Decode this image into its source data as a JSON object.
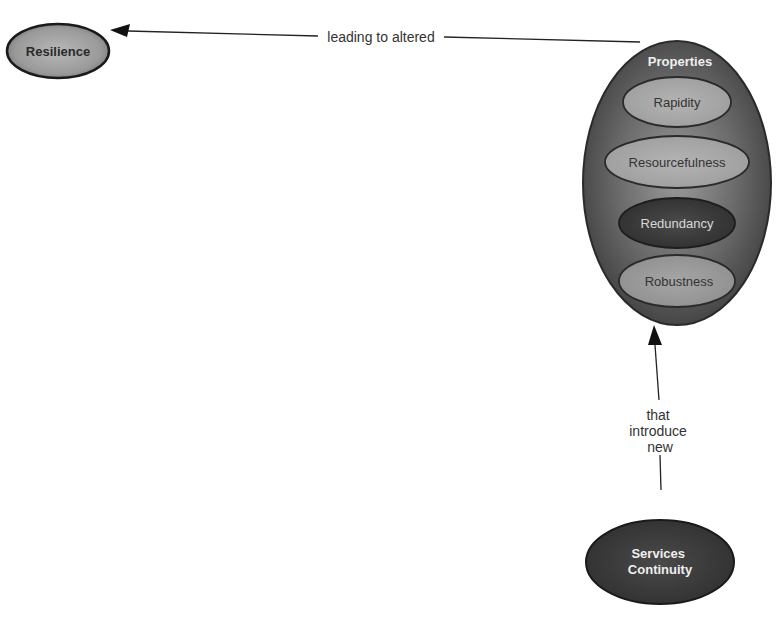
{
  "diagram": {
    "type": "concept-map",
    "colors": {
      "background": "#ffffff",
      "edge": "#222222",
      "node_outline": "#1a1a1a",
      "dark_fill": "#3a3a3a",
      "mid_fill": "#8a8a8a",
      "light_fill": "#a8a8a8",
      "light_text": "#ececec",
      "dark_text": "#2a2a2a"
    },
    "nodes": {
      "resilience": {
        "label": "Resilience"
      },
      "properties": {
        "label": "Properties",
        "children": [
          {
            "label": "Rapidity"
          },
          {
            "label": "Resourcefulness"
          },
          {
            "label": "Redundancy"
          },
          {
            "label": "Robustness"
          }
        ]
      },
      "services_continuity": {
        "label_line1": "Services",
        "label_line2": "Continuity"
      }
    },
    "edges": {
      "properties_to_resilience": {
        "label": "leading to altered"
      },
      "services_to_properties": {
        "label_line1": "that",
        "label_line2": "introduce",
        "label_line3": "new"
      }
    }
  }
}
